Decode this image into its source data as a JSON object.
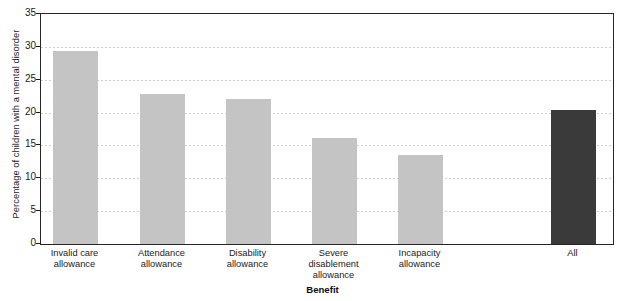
{
  "chart_data": {
    "type": "bar",
    "title": "",
    "xlabel": "Benefit",
    "ylabel": "Percentage of children with a mental disorder",
    "categories": [
      "Invalid care allowance",
      "Attendance allowance",
      "Disability allowance",
      "Severe disablement allowance",
      "Incapacity allowance",
      "All"
    ],
    "category_lines": [
      [
        "Invalid care",
        "allowance"
      ],
      [
        "Attendance",
        "allowance"
      ],
      [
        "Disability",
        "allowance"
      ],
      [
        "Severe",
        "disablement",
        "allowance"
      ],
      [
        "Incapacity",
        "allowance"
      ],
      [
        "All"
      ]
    ],
    "values": [
      29.4,
      22.9,
      22.0,
      16.1,
      13.6,
      20.4
    ],
    "bar_colors": [
      "#c4c4c4",
      "#c4c4c4",
      "#c4c4c4",
      "#c4c4c4",
      "#c4c4c4",
      "#3a3a3a"
    ],
    "ylim": [
      0,
      35
    ],
    "ytick_labels": [
      "0",
      "5",
      "10",
      "15",
      "20",
      "25",
      "30",
      "35"
    ],
    "ytick_values": [
      0,
      5,
      10,
      15,
      20,
      25,
      30,
      35
    ],
    "grid": true,
    "grid_axis": "y",
    "legend": null,
    "legend_position": "none"
  },
  "style": {
    "background": "#ffffff",
    "axis_color": "#262626",
    "grid_color": "#d0d0d0",
    "text_color": "#1a1a1a",
    "bar_grey": "#c4c4c4",
    "bar_dark": "#3a3a3a"
  }
}
